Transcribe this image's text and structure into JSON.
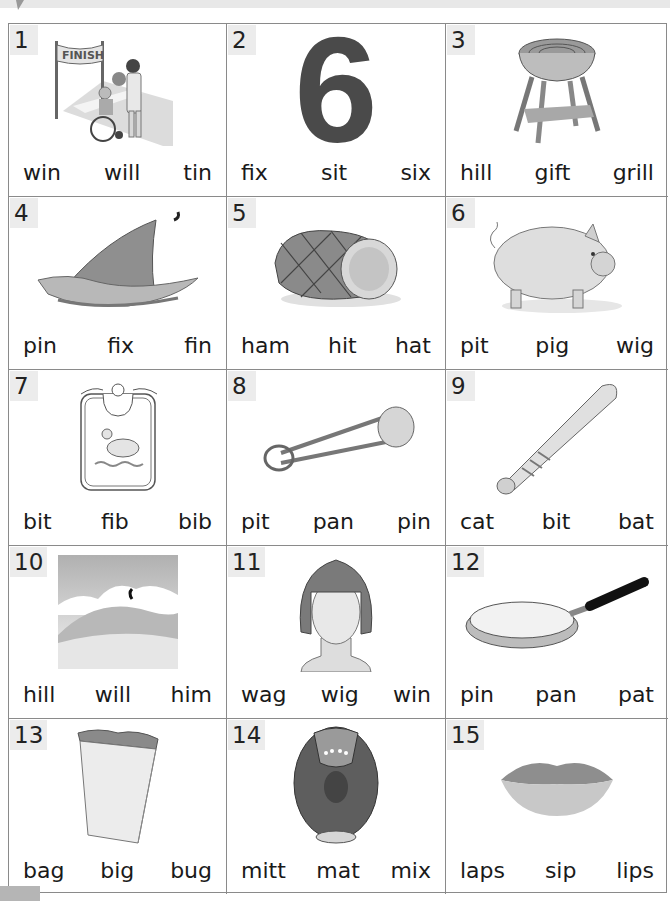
{
  "worksheet": {
    "items": [
      {
        "number": "1",
        "picture": "finish-line-wheelchair-trophy",
        "choices": [
          "win",
          "will",
          "tin"
        ]
      },
      {
        "number": "2",
        "picture": "number-six",
        "picture_text": "6",
        "choices": [
          "fix",
          "sit",
          "six"
        ]
      },
      {
        "number": "3",
        "picture": "grill",
        "choices": [
          "hill",
          "gift",
          "grill"
        ]
      },
      {
        "number": "4",
        "picture": "shark-fin",
        "choices": [
          "pin",
          "fix",
          "fin"
        ]
      },
      {
        "number": "5",
        "picture": "ham",
        "choices": [
          "ham",
          "hit",
          "hat"
        ]
      },
      {
        "number": "6",
        "picture": "pig",
        "choices": [
          "pit",
          "pig",
          "wig"
        ]
      },
      {
        "number": "7",
        "picture": "bib-with-duck",
        "choices": [
          "bit",
          "fib",
          "bib"
        ]
      },
      {
        "number": "8",
        "picture": "safety-pin",
        "choices": [
          "pit",
          "pan",
          "pin"
        ]
      },
      {
        "number": "9",
        "picture": "baseball-bat",
        "choices": [
          "cat",
          "bit",
          "bat"
        ]
      },
      {
        "number": "10",
        "picture": "hill-landscape",
        "choices": [
          "hill",
          "will",
          "him"
        ]
      },
      {
        "number": "11",
        "picture": "wig",
        "choices": [
          "wag",
          "wig",
          "win"
        ]
      },
      {
        "number": "12",
        "picture": "frying-pan",
        "choices": [
          "pin",
          "pan",
          "pat"
        ]
      },
      {
        "number": "13",
        "picture": "paper-bag",
        "choices": [
          "bag",
          "big",
          "bug"
        ]
      },
      {
        "number": "14",
        "picture": "baseball-mitt",
        "choices": [
          "mitt",
          "mat",
          "mix"
        ]
      },
      {
        "number": "15",
        "picture": "lips",
        "choices": [
          "laps",
          "sip",
          "lips"
        ]
      }
    ],
    "finish_banner": "FINISH"
  },
  "colors": {
    "grid_line": "#8a8a8a",
    "number_tab": "#ececec",
    "text": "#1a1a1a",
    "six_digit": "#4a4a4a"
  }
}
